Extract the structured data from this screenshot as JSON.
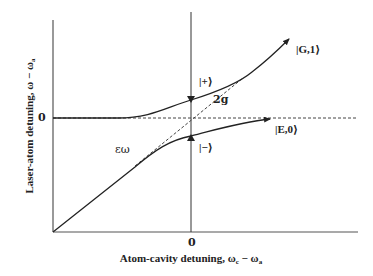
{
  "diagram": {
    "type": "avoided-crossing energy level diagram",
    "axes": {
      "y_label": "Laser-atom detuning, ω − ω",
      "y_label_subscript": "a",
      "x_label": "Atom-cavity detuning, ω",
      "x_label_sub1": "c",
      "x_label_mid": " − ω",
      "x_label_sub2": "a",
      "y_zero_tick": "0",
      "x_zero_tick": "0"
    },
    "labels": {
      "plus_state": "|+⟩",
      "minus_state": "|−⟩",
      "g1_state": "|G,1⟩",
      "e0_state": "|E,0⟩",
      "splitting": "2g",
      "epsilon_omega": "εω"
    },
    "colors": {
      "line": "#222222",
      "dashed": "#444444",
      "background": "#ffffff"
    }
  }
}
